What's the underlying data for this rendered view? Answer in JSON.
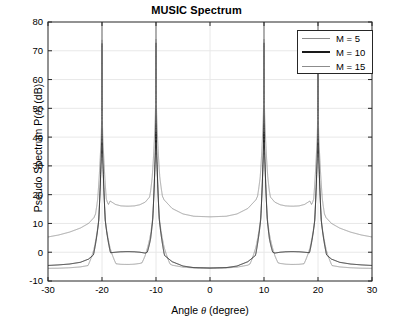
{
  "chart_data": {
    "type": "line",
    "title": "MUSIC Spectrum",
    "xlabel": "Angle θ (degree)",
    "ylabel": "Pseudo Spectrum P(θ) (dB)",
    "xlim": [
      -30,
      30
    ],
    "ylim": [
      -10,
      80
    ],
    "xticks": [
      -30,
      -20,
      -10,
      0,
      10,
      20,
      30
    ],
    "xticklabels": [
      "-30",
      "-20",
      "-10",
      "0",
      "10",
      "20",
      "30"
    ],
    "yticks": [
      -10,
      0,
      10,
      20,
      30,
      40,
      50,
      60,
      70,
      80
    ],
    "yticklabels": [
      "-10",
      "0",
      "10",
      "20",
      "30",
      "40",
      "50",
      "60",
      "70",
      "80"
    ],
    "grid": true,
    "legend_position": "upper right",
    "peaks_deg": [
      -20,
      -10,
      10,
      20
    ],
    "series": [
      {
        "name": "M = 5",
        "color": "#8c8c8c",
        "baseline_db": -5.5,
        "interpeak_min_db": -4.0,
        "center_min_db": -5.5,
        "edge_db": -5.6,
        "peak_db": 80,
        "peak_width_deg": 2.6,
        "x": [
          -30,
          -28,
          -26,
          -24,
          -22.5,
          -21.5,
          -20.6,
          -20.15,
          -20,
          -19.85,
          -19.4,
          -18.5,
          -17.5,
          -16.5,
          -15.5,
          -15,
          -14,
          -13,
          -12,
          -11,
          -10.6,
          -10.15,
          -10,
          -9.85,
          -9.4,
          -8.5,
          -7,
          -5,
          -3,
          0,
          3,
          5,
          7,
          8.5,
          9.4,
          9.85,
          10,
          10.15,
          10.6,
          11,
          12,
          13,
          14,
          15,
          15.5,
          16.5,
          17.5,
          18.5,
          19.4,
          19.85,
          20,
          20.15,
          20.6,
          21.5,
          22.5,
          24,
          26,
          28,
          30
        ],
        "y": [
          -5.6,
          -5.55,
          -5.4,
          -5.1,
          -4.6,
          -3.8,
          -1.2,
          9.0,
          80,
          9.0,
          -1.2,
          -3.3,
          -4.0,
          -4.2,
          -4.25,
          -4.25,
          -4.15,
          -3.9,
          -3.4,
          -2.0,
          -0.5,
          9.3,
          80,
          9.3,
          -0.5,
          -3.0,
          -4.5,
          -5.2,
          -5.45,
          -5.5,
          -5.45,
          -5.2,
          -4.5,
          -3.0,
          -0.5,
          9.3,
          80,
          9.3,
          -0.5,
          -2.0,
          -3.4,
          -3.9,
          -4.15,
          -4.25,
          -4.25,
          -4.2,
          -4.0,
          -3.3,
          -1.2,
          9.0,
          80,
          9.0,
          -1.2,
          -3.8,
          -4.6,
          -5.1,
          -5.4,
          -5.55,
          -5.6
        ]
      },
      {
        "name": "M = 10",
        "color": "#1a1a1a",
        "baseline_db": -5.5,
        "interpeak_min_db": 0.2,
        "center_min_db": -5.5,
        "edge_db": -4.6,
        "peak_db": 80,
        "peak_width_deg": 1.6,
        "x": [
          -30,
          -28,
          -26,
          -24,
          -22.5,
          -21.5,
          -20.6,
          -20.2,
          -20,
          -19.8,
          -19.4,
          -18.5,
          -17.5,
          -16.5,
          -15.5,
          -15,
          -14,
          -13,
          -12,
          -11,
          -10.6,
          -10.2,
          -10,
          -9.8,
          -9.4,
          -8.5,
          -7,
          -5,
          -3,
          0,
          3,
          5,
          7,
          8.5,
          9.4,
          9.8,
          10,
          10.2,
          10.6,
          11,
          12,
          13,
          14,
          15,
          15.5,
          16.5,
          17.5,
          18.5,
          19.4,
          19.8,
          20,
          20.2,
          20.6,
          21.5,
          22.5,
          24,
          26,
          28,
          30
        ],
        "y": [
          -4.6,
          -4.4,
          -4.1,
          -3.5,
          -2.4,
          -0.8,
          2.6,
          12.0,
          80,
          12.0,
          2.6,
          -0.2,
          0.0,
          0.15,
          0.2,
          0.2,
          0.15,
          0.0,
          -0.3,
          0.6,
          3.0,
          12.2,
          80,
          12.2,
          3.0,
          -1.0,
          -3.3,
          -4.8,
          -5.35,
          -5.5,
          -5.35,
          -4.8,
          -3.3,
          -1.0,
          3.0,
          12.2,
          80,
          12.2,
          3.0,
          0.6,
          -0.3,
          0.0,
          0.15,
          0.2,
          0.2,
          0.15,
          0.0,
          -0.2,
          2.6,
          12.0,
          80,
          12.0,
          2.6,
          -0.8,
          -2.4,
          -3.5,
          -4.1,
          -4.4,
          -4.6
        ]
      },
      {
        "name": "M = 15",
        "color": "#8c8c8c",
        "baseline_db": 12.3,
        "interpeak_min_db": 16.0,
        "center_min_db": 12.3,
        "edge_db": 5.3,
        "peak_db": 80,
        "peak_width_deg": 1.2,
        "x": [
          -30,
          -28,
          -26,
          -24,
          -22.5,
          -21.5,
          -20.8,
          -20.3,
          -20,
          -19.7,
          -19.2,
          -18.5,
          -17.5,
          -16.5,
          -15.5,
          -15,
          -14,
          -13,
          -12,
          -11,
          -10.7,
          -10.25,
          -10,
          -9.75,
          -9.3,
          -8.5,
          -7,
          -5,
          -3,
          0,
          3,
          5,
          7,
          8.5,
          9.3,
          9.75,
          10,
          10.25,
          10.7,
          11,
          12,
          13,
          14,
          15,
          15.5,
          16.5,
          17.5,
          18.5,
          19.2,
          19.7,
          20,
          20.3,
          20.8,
          21.5,
          22.5,
          24,
          26,
          28,
          30
        ],
        "y": [
          5.3,
          6.0,
          7.0,
          8.4,
          10.0,
          12.0,
          15.0,
          22.0,
          80,
          22.0,
          15.0,
          17.8,
          16.6,
          16.1,
          16.0,
          16.0,
          16.1,
          16.5,
          17.4,
          19.6,
          21.5,
          28.0,
          80,
          28.0,
          21.5,
          18.2,
          15.2,
          13.3,
          12.5,
          12.3,
          12.5,
          13.3,
          15.2,
          18.2,
          21.5,
          28.0,
          80,
          28.0,
          21.5,
          19.6,
          17.4,
          16.5,
          16.1,
          16.0,
          16.0,
          16.1,
          16.6,
          17.8,
          15.0,
          22.0,
          80,
          22.0,
          15.0,
          12.0,
          10.0,
          8.4,
          7.0,
          6.0,
          5.3
        ]
      }
    ]
  },
  "legend": {
    "entries": [
      {
        "label": "M = 5"
      },
      {
        "label": "M = 10"
      },
      {
        "label": "M = 15"
      }
    ]
  },
  "axes": {
    "title": "MUSIC Spectrum",
    "xlabel_prefix": "Angle ",
    "xlabel_var": "θ",
    "xlabel_suffix": " (degree)",
    "ylabel_prefix": "Pseudo Spectrum P(",
    "ylabel_var": "θ",
    "ylabel_suffix": ") (dB)"
  }
}
